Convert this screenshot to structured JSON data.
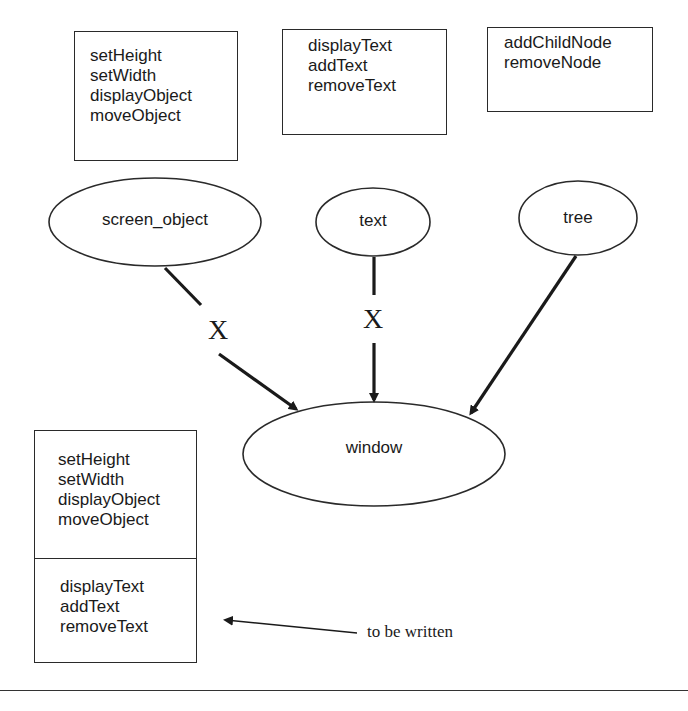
{
  "boxes": {
    "screen_object_methods": {
      "lines": [
        "setHeight",
        "setWidth",
        "displayObject",
        "moveObject"
      ]
    },
    "text_methods": {
      "lines": [
        "displayText",
        "addText",
        "removeText"
      ]
    },
    "tree_methods": {
      "lines": [
        "addChildNode",
        "removeNode"
      ]
    },
    "window_methods": {
      "inherited": [
        "setHeight",
        "setWidth",
        "displayObject",
        "moveObject"
      ],
      "new": [
        "displayText",
        "addText",
        "removeText"
      ]
    }
  },
  "nodes": {
    "screen_object": "screen_object",
    "text": "text",
    "tree": "tree",
    "window": "window"
  },
  "edges": [
    {
      "from": "screen_object",
      "to": "window",
      "blocked": true,
      "mark": "X"
    },
    {
      "from": "text",
      "to": "window",
      "blocked": true,
      "mark": "X"
    },
    {
      "from": "tree",
      "to": "window",
      "blocked": false
    }
  ],
  "annotation": {
    "label": "to be written"
  }
}
